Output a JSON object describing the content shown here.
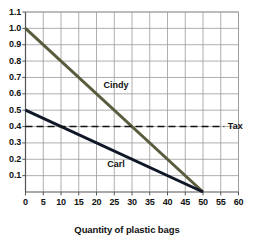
{
  "chart_data": {
    "type": "line",
    "title": "",
    "xlabel": "Quantity of plastic bags",
    "ylabel": "",
    "xlim": [
      0,
      60
    ],
    "ylim": [
      0,
      1.1
    ],
    "xticks": [
      "0",
      "5",
      "10",
      "15",
      "20",
      "25",
      "30",
      "35",
      "40",
      "45",
      "50",
      "55",
      "60"
    ],
    "yticks": [
      "0.1",
      "0.2",
      "0.3",
      "0.4",
      "0.5",
      "0.6",
      "0.7",
      "0.8",
      "0.9",
      "1.0",
      "1.1"
    ],
    "grid": true,
    "legend_position": "inline-labels",
    "series": [
      {
        "name": "Cindy",
        "color": "#5b5b3e",
        "style": "solid",
        "points": [
          [
            0,
            1.0
          ],
          [
            50,
            0.0
          ]
        ],
        "label_x": 22,
        "label_y": 0.645
      },
      {
        "name": "Carl",
        "color": "#101828",
        "style": "solid",
        "points": [
          [
            0,
            0.5
          ],
          [
            50,
            0.0
          ]
        ],
        "label_x": 23,
        "label_y": 0.165
      },
      {
        "name": "Tax",
        "color": "#111111",
        "style": "dashed",
        "points": [
          [
            0,
            0.4
          ],
          [
            56,
            0.4
          ]
        ],
        "label_x": 57,
        "label_y": 0.4
      }
    ],
    "annotations": [
      {
        "text": "Cindy",
        "x": 22,
        "y": 0.645
      },
      {
        "text": "Carl",
        "x": 23,
        "y": 0.165
      },
      {
        "text": "Tax",
        "x": 57,
        "y": 0.4
      }
    ],
    "colors": {
      "grid": "#9a9a9a",
      "axis": "#555555",
      "background": "#ffffff",
      "cindy": "#5b5b3e",
      "carl": "#101828",
      "tax": "#111111"
    }
  }
}
